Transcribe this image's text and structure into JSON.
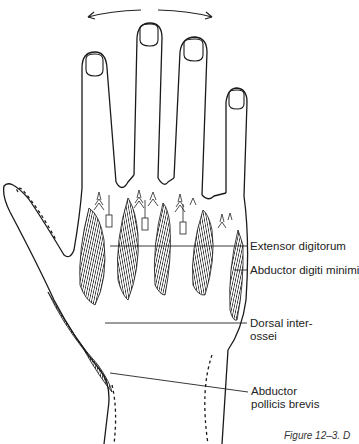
{
  "figure": {
    "caption": "Figure 12–3. D",
    "motion_arrows": [
      "abduction-left-arrow",
      "abduction-right-arrow"
    ]
  },
  "labels": [
    {
      "id": "extensor-digitorum",
      "lines": [
        "Extensor digitorum"
      ]
    },
    {
      "id": "abductor-digiti-minimi",
      "lines": [
        "Abductor digiti minimi"
      ]
    },
    {
      "id": "dorsal-interossei",
      "lines": [
        "Dorsal inter-",
        "ossei"
      ]
    },
    {
      "id": "abductor-pollicis-brevis",
      "lines": [
        "Abductor",
        "pollicis brevis"
      ]
    }
  ]
}
